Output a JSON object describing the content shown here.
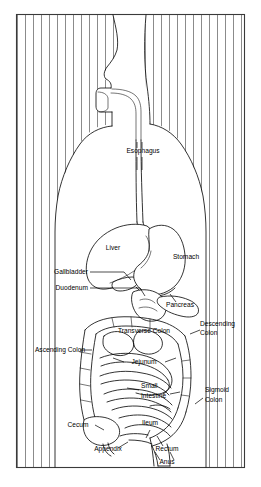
{
  "figure": {
    "type": "anatomical-line-diagram",
    "frame": {
      "x": 16,
      "y": 14,
      "width": 229,
      "height": 454
    },
    "colors": {
      "background": "#ffffff",
      "ink": "#000000",
      "hatching": "#2b2b2b",
      "frame": "#3a3a3a"
    }
  },
  "labels": [
    {
      "id": "esophagus",
      "text": "Esophagus",
      "x": 143,
      "y": 153,
      "anchor": "middle"
    },
    {
      "id": "liver",
      "text": "Liver",
      "x": 113,
      "y": 250,
      "anchor": "middle"
    },
    {
      "id": "stomach",
      "text": "Stomach",
      "x": 186,
      "y": 259,
      "anchor": "middle"
    },
    {
      "id": "gallbladder",
      "text": "Gallbladder",
      "x": 88,
      "y": 274,
      "anchor": "end"
    },
    {
      "id": "duodenum",
      "text": "Duodenum",
      "x": 88,
      "y": 290,
      "anchor": "end"
    },
    {
      "id": "pancreas",
      "text": "Pancreas",
      "x": 180,
      "y": 307,
      "anchor": "middle"
    },
    {
      "id": "transverse-colon",
      "text": "Transverse Colon",
      "x": 144,
      "y": 333,
      "anchor": "middle"
    },
    {
      "id": "descending-colon-1",
      "text": "Descending",
      "x": 202,
      "y": 326,
      "anchor": "start"
    },
    {
      "id": "descending-colon-2",
      "text": "Colon",
      "x": 202,
      "y": 335,
      "anchor": "start"
    },
    {
      "id": "ascending-colon",
      "text": "Ascending Colon",
      "x": 62,
      "y": 352,
      "anchor": "middle"
    },
    {
      "id": "jejunum",
      "text": "Jejunum",
      "x": 144,
      "y": 364,
      "anchor": "middle"
    },
    {
      "id": "small-intestine-1",
      "text": "Small",
      "x": 141,
      "y": 387,
      "anchor": "start"
    },
    {
      "id": "small-intestine-2",
      "text": "Intestine",
      "x": 141,
      "y": 397,
      "anchor": "start"
    },
    {
      "id": "sigmoid-colon-1",
      "text": "Sigmoid",
      "x": 205,
      "y": 392,
      "anchor": "start"
    },
    {
      "id": "sigmoid-colon-2",
      "text": "Colon",
      "x": 205,
      "y": 402,
      "anchor": "start"
    },
    {
      "id": "cecum",
      "text": "Cecum",
      "x": 78,
      "y": 427,
      "anchor": "middle"
    },
    {
      "id": "ileum",
      "text": "Ileum",
      "x": 150,
      "y": 425,
      "anchor": "middle"
    },
    {
      "id": "appendix",
      "text": "Appendix",
      "x": 108,
      "y": 451,
      "anchor": "middle"
    },
    {
      "id": "rectum",
      "text": "Rectum",
      "x": 163,
      "y": 451,
      "anchor": "middle"
    },
    {
      "id": "anus",
      "text": "Anus",
      "x": 166,
      "y": 464,
      "anchor": "middle"
    }
  ],
  "organs": [
    "esophagus",
    "liver",
    "stomach",
    "gallbladder",
    "duodenum",
    "pancreas",
    "transverse colon",
    "descending colon",
    "ascending colon",
    "jejunum",
    "small intestine",
    "sigmoid colon",
    "cecum",
    "ileum",
    "appendix",
    "rectum",
    "anus"
  ]
}
